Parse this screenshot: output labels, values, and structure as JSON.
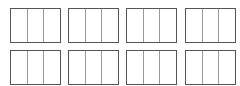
{
  "layout": {
    "rows": 2,
    "columns": 4,
    "cells_per_box": 3
  },
  "colors": {
    "border": "#555555",
    "divider": "#9a9a9a",
    "background": "#ffffff"
  },
  "boxes": [
    {
      "row": 0,
      "col": 0,
      "cells": [
        "",
        "",
        ""
      ]
    },
    {
      "row": 0,
      "col": 1,
      "cells": [
        "",
        "",
        ""
      ]
    },
    {
      "row": 0,
      "col": 2,
      "cells": [
        "",
        "",
        ""
      ]
    },
    {
      "row": 0,
      "col": 3,
      "cells": [
        "",
        "",
        ""
      ]
    },
    {
      "row": 1,
      "col": 0,
      "cells": [
        "",
        "",
        ""
      ]
    },
    {
      "row": 1,
      "col": 1,
      "cells": [
        "",
        "",
        ""
      ]
    },
    {
      "row": 1,
      "col": 2,
      "cells": [
        "",
        "",
        ""
      ]
    },
    {
      "row": 1,
      "col": 3,
      "cells": [
        "",
        "",
        ""
      ]
    }
  ]
}
